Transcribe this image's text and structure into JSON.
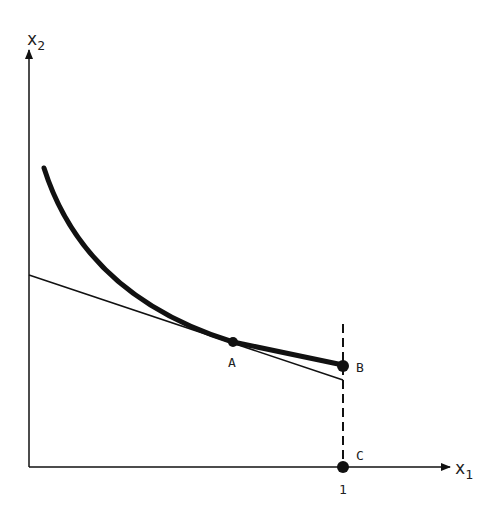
{
  "diagram": {
    "axes": {
      "x_label": "x",
      "x_sub": "1",
      "y_label": "x",
      "y_sub": "2"
    },
    "points": [
      {
        "name": "A",
        "label": "A"
      },
      {
        "name": "B",
        "label": "B"
      },
      {
        "name": "C",
        "label": "C"
      }
    ],
    "tick_x": "1",
    "colors": {
      "ink": "#111111",
      "background": "#ffffff"
    },
    "elements": [
      "convex curve (thick) ending at B",
      "tangent line through A",
      "dashed vertical line at x1 = 1"
    ]
  }
}
